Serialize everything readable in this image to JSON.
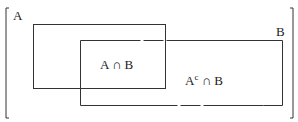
{
  "diagram": {
    "type": "venn-rectangles",
    "universe_brackets": true,
    "sets": [
      {
        "id": "A",
        "label": "A"
      },
      {
        "id": "B",
        "label": "B"
      }
    ],
    "regions": [
      {
        "id": "a-intersect-b",
        "label_main": "A ∩ B"
      },
      {
        "id": "acomp-intersect-b",
        "label_base": "A",
        "label_sup": "c",
        "label_rest": " ∩ B"
      }
    ],
    "stroke_color": "#333333",
    "background": "#ffffff"
  }
}
